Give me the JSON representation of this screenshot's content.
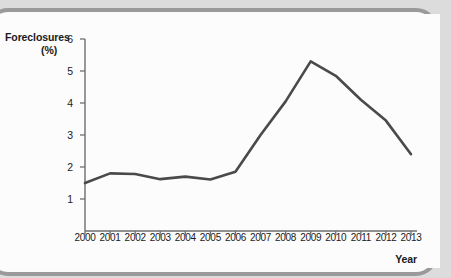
{
  "chart_data": {
    "type": "line",
    "title": "",
    "xlabel": "Year",
    "ylabel": "Foreclosures (%)",
    "ylabel_lines": [
      "Foreclosures",
      "(%)"
    ],
    "categories": [
      "2000",
      "2001",
      "2002",
      "2003",
      "2004",
      "2005",
      "2006",
      "2007",
      "2008",
      "2009",
      "2010",
      "2011",
      "2012",
      "2013"
    ],
    "x": [
      2000,
      2001,
      2002,
      2003,
      2004,
      2005,
      2006,
      2007,
      2008,
      2009,
      2010,
      2011,
      2012,
      2013
    ],
    "values": [
      1.5,
      1.8,
      1.78,
      1.62,
      1.7,
      1.61,
      1.85,
      3.0,
      4.05,
      5.3,
      4.85,
      4.1,
      3.45,
      2.4
    ],
    "series": [
      {
        "name": "Foreclosures (%)",
        "values": [
          1.5,
          1.8,
          1.78,
          1.62,
          1.7,
          1.61,
          1.85,
          3.0,
          4.05,
          5.3,
          4.85,
          4.1,
          3.45,
          2.4
        ]
      }
    ],
    "ytick_labels": [
      "1",
      "2",
      "3",
      "4",
      "5",
      "6"
    ],
    "yticks": [
      1,
      2,
      3,
      4,
      5,
      6
    ],
    "ylim": [
      0,
      6
    ],
    "xlim": [
      2000,
      2013
    ],
    "grid": false,
    "legend": false,
    "legend_position": "none",
    "line_color": "#4a4a4a",
    "axis_color": "#6e6e6e"
  },
  "colors": {
    "frame_border": "#9a9a9a",
    "page_background": "#dcdcdc",
    "plot_background": "#fcfcfc",
    "line": "#4a4a4a",
    "text": "#1a1a1a"
  }
}
